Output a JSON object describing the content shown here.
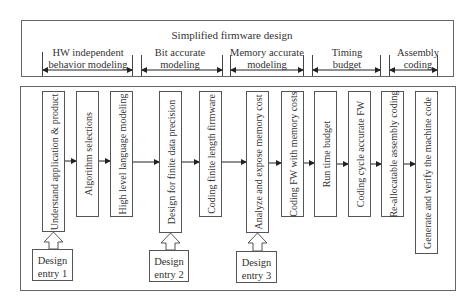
{
  "header": {
    "title": "Simplified firmware design",
    "phases": [
      {
        "label_line1": "HW independent",
        "label_line2": "behavior modeling"
      },
      {
        "label_line1": "Bit accurate",
        "label_line2": "modeling"
      },
      {
        "label_line1": "Memory accurate",
        "label_line2": "modeling"
      },
      {
        "label_line1": "Timing",
        "label_line2": "budget"
      },
      {
        "label_line1": "Assembly",
        "label_line2": "coding"
      }
    ]
  },
  "steps": [
    {
      "label": "Understand application & product"
    },
    {
      "label": "Algorithm selections"
    },
    {
      "label": "High level language modeling"
    },
    {
      "label": "Design for finite data precision"
    },
    {
      "label": "Coding finite length firmware"
    },
    {
      "label": "Analyze and expose memory cost"
    },
    {
      "label": "Coding FW with memory costs"
    },
    {
      "label": "Run time budget"
    },
    {
      "label": "Coding cycle accurate FW"
    },
    {
      "label": "Re-allocatable assembly coding"
    },
    {
      "label": "Generate and verify the machine code"
    }
  ],
  "entries": [
    {
      "line1": "Design",
      "line2": "entry 1"
    },
    {
      "line1": "Design",
      "line2": "entry 2"
    },
    {
      "line1": "Design",
      "line2": "entry 3"
    }
  ]
}
